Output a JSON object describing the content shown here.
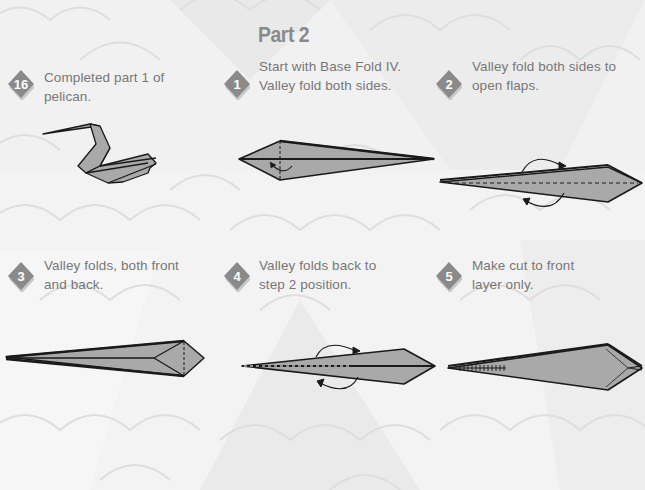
{
  "page": {
    "title": "Part 2"
  },
  "colors": {
    "background": "#f3f3f3",
    "badge": "#8a8a8a",
    "badge_shadow": "#c8c8c8",
    "text": "#777777",
    "paper_fill": "#a9a9a9",
    "paper_stroke": "#1a1a1a"
  },
  "steps": [
    {
      "number": "16",
      "line1": "Completed part 1 of",
      "line2": "pelican.",
      "diagram": "completed-pelican-part1"
    },
    {
      "number": "1",
      "line1": "Start with Base Fold IV.",
      "line2": "Valley fold both sides.",
      "diagram": "kite-base-valley-fold"
    },
    {
      "number": "2",
      "line1": "Valley fold both sides to",
      "line2": "open flaps.",
      "diagram": "open-flaps"
    },
    {
      "number": "3",
      "line1": "Valley folds, both front",
      "line2": "and back.",
      "diagram": "valley-folds-front-back"
    },
    {
      "number": "4",
      "line1": "Valley folds back to",
      "line2": "step 2 position.",
      "diagram": "fold-back-step2"
    },
    {
      "number": "5",
      "line1": "Make cut to front",
      "line2": "layer only.",
      "diagram": "cut-front-layer"
    }
  ]
}
